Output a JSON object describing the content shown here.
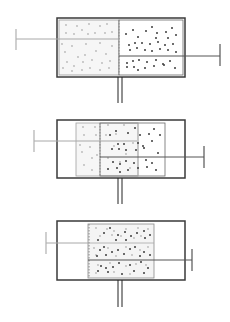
{
  "diagram": {
    "colors": {
      "outline": "#3a3a3a",
      "left_gas": "#b8b8b8",
      "right_gas": "#3c3c3c",
      "left_piston_rod": "#a8a8a8",
      "right_piston_rod": "#555555",
      "fill_light": "#f4f4f4"
    },
    "panels": [
      {
        "id": "stage-1",
        "outer": {
          "x": 57,
          "y": 18,
          "w": 128,
          "h": 59
        },
        "left_region": {
          "x": 59,
          "y": 20,
          "w": 60,
          "h": 55
        },
        "right_region": {
          "x": 119,
          "y": 20,
          "w": 64,
          "h": 55
        },
        "left_rod_y": 39,
        "right_rod_y": 56,
        "left_handle_x": 16,
        "right_handle_x": 220,
        "valve_x": 120
      },
      {
        "id": "stage-2",
        "outer": {
          "x": 57,
          "y": 120,
          "w": 128,
          "h": 58
        },
        "left_region": {
          "x": 76,
          "y": 123,
          "w": 62,
          "h": 53
        },
        "right_region": {
          "x": 100,
          "y": 123,
          "w": 65,
          "h": 53
        },
        "left_rod_y": 141,
        "right_rod_y": 157,
        "left_handle_x": 34,
        "right_handle_x": 204,
        "valve_x": 120
      },
      {
        "id": "stage-3",
        "outer": {
          "x": 57,
          "y": 221,
          "w": 128,
          "h": 59
        },
        "left_region": {
          "x": 88,
          "y": 224,
          "w": 66,
          "h": 54
        },
        "right_region": {
          "x": 88,
          "y": 224,
          "w": 66,
          "h": 54
        },
        "left_rod_y": 243,
        "right_rod_y": 260,
        "left_handle_x": 46,
        "right_handle_x": 192,
        "valve_x": 120
      }
    ]
  }
}
